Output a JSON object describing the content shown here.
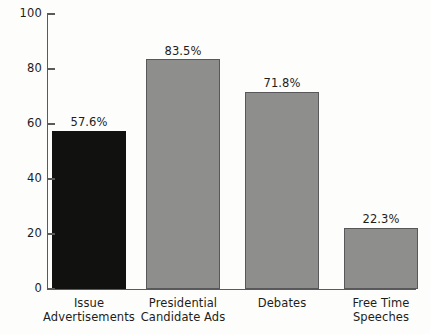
{
  "chart_data": {
    "type": "bar",
    "title": "",
    "subtitle": "",
    "xlabel": "",
    "ylabel": "",
    "ylim": [
      0,
      100
    ],
    "yticks": [
      0,
      20,
      40,
      60,
      80,
      100
    ],
    "ytick_labels": [
      "0",
      "20",
      "40",
      "60",
      "80",
      "100"
    ],
    "grid": false,
    "legend": false,
    "categories": [
      "Issue Advertisements",
      "Presidential Candidate Ads",
      "Debates",
      "Free Time Speeches"
    ],
    "category_lines": [
      [
        "Issue",
        "Advertisements"
      ],
      [
        "Presidential",
        "Candidate Ads"
      ],
      [
        "Debates",
        ""
      ],
      [
        "Free Time",
        "Speeches"
      ]
    ],
    "values": [
      57.6,
      83.5,
      71.8,
      22.3
    ],
    "value_labels": [
      "57.6%",
      "83.5%",
      "71.8%",
      "22.3%"
    ],
    "bar_colors": [
      "#111110",
      "#8e8e8c",
      "#8e8e8c",
      "#8e8e8c"
    ],
    "colors": {
      "background": "#fdfdfb",
      "axis": "#5a5a58",
      "text": "#1d1d1b",
      "bar_highlight": "#111110",
      "bar_default": "#8e8e8c",
      "bar_border": "#58585a"
    }
  }
}
